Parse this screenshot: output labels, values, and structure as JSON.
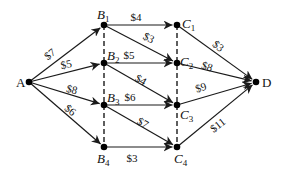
{
  "diagram": {
    "type": "directed-network",
    "colors": {
      "line": "#1a1a1a",
      "node": "#000000",
      "background": "#ffffff"
    },
    "nodes": [
      {
        "id": "A",
        "label": "A",
        "sub": "",
        "x": 29,
        "y": 82,
        "lx": 16,
        "ly": 87
      },
      {
        "id": "B1",
        "label": "B",
        "sub": "1",
        "x": 104,
        "y": 25,
        "lx": 97,
        "ly": 19
      },
      {
        "id": "B2",
        "label": "B",
        "sub": "2",
        "x": 104,
        "y": 63,
        "lx": 107,
        "ly": 60
      },
      {
        "id": "B3",
        "label": "B",
        "sub": "3",
        "x": 104,
        "y": 105,
        "lx": 107,
        "ly": 102
      },
      {
        "id": "B4",
        "label": "B",
        "sub": "4",
        "x": 104,
        "y": 147,
        "lx": 97,
        "ly": 163
      },
      {
        "id": "C1",
        "label": "C",
        "sub": "1",
        "x": 177,
        "y": 25,
        "lx": 182,
        "ly": 28
      },
      {
        "id": "C2",
        "label": "C",
        "sub": "2",
        "x": 177,
        "y": 63,
        "lx": 180,
        "ly": 66
      },
      {
        "id": "C3",
        "label": "C",
        "sub": "3",
        "x": 177,
        "y": 105,
        "lx": 180,
        "ly": 119
      },
      {
        "id": "C4",
        "label": "C",
        "sub": "4",
        "x": 177,
        "y": 147,
        "lx": 174,
        "ly": 163
      },
      {
        "id": "D",
        "label": "D",
        "sub": "",
        "x": 256,
        "y": 82,
        "lx": 262,
        "ly": 87
      }
    ],
    "edges": [
      {
        "from": "A",
        "to": "B1",
        "label": "$7",
        "lx": 52,
        "ly": 57,
        "rot": -38
      },
      {
        "from": "A",
        "to": "B2",
        "label": "$5",
        "lx": 67,
        "ly": 68,
        "rot": -12
      },
      {
        "from": "A",
        "to": "B3",
        "label": "$8",
        "lx": 71,
        "ly": 93,
        "rot": 14
      },
      {
        "from": "A",
        "to": "B4",
        "label": "$6",
        "lx": 68,
        "ly": 113,
        "rot": 38
      },
      {
        "from": "B1",
        "to": "C1",
        "label": "$4",
        "lx": 136,
        "ly": 21,
        "rot": 0
      },
      {
        "from": "B1",
        "to": "C2",
        "label": "$3",
        "lx": 147,
        "ly": 41,
        "rot": 28
      },
      {
        "from": "B2",
        "to": "C2",
        "label": "$5",
        "lx": 129,
        "ly": 59,
        "rot": 0
      },
      {
        "from": "B2",
        "to": "C3",
        "label": "$4",
        "lx": 139,
        "ly": 83,
        "rot": 30
      },
      {
        "from": "B3",
        "to": "C3",
        "label": "$6",
        "lx": 130,
        "ly": 101,
        "rot": 0
      },
      {
        "from": "B3",
        "to": "C4",
        "label": "$7",
        "lx": 141,
        "ly": 126,
        "rot": 30
      },
      {
        "from": "B4",
        "to": "C4",
        "label": "$3",
        "lx": 132,
        "ly": 162,
        "rot": 0
      },
      {
        "from": "C1",
        "to": "D",
        "label": "$3",
        "lx": 216,
        "ly": 49,
        "rot": 38
      },
      {
        "from": "C2",
        "to": "D",
        "label": "$8",
        "lx": 206,
        "ly": 70,
        "rot": 18
      },
      {
        "from": "C3",
        "to": "D",
        "label": "$9",
        "lx": 202,
        "ly": 91,
        "rot": -18
      },
      {
        "from": "C4",
        "to": "D",
        "label": "$11",
        "lx": 220,
        "ly": 128,
        "rot": -38
      }
    ],
    "dashed_columns": [
      {
        "id": "B-column",
        "x": 104,
        "y1": 25,
        "y2": 147
      },
      {
        "id": "C-column",
        "x": 177,
        "y1": 25,
        "y2": 147
      }
    ]
  }
}
